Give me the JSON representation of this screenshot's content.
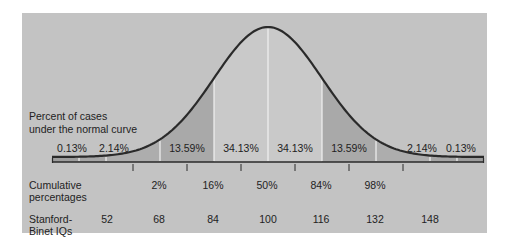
{
  "chart_data": {
    "type": "area",
    "title": "",
    "row_labels": {
      "percent": "Percent of cases under the normal curve",
      "percent_line1": "Percent of cases",
      "percent_line2": "under the normal curve",
      "cumulative_line1": "Cumulative",
      "cumulative_line2": "percentages",
      "iq_line1": "Stanford-",
      "iq_line2": "Binet IQs"
    },
    "bands": [
      {
        "range_sd": "-4 to -3",
        "percent": "0.13%"
      },
      {
        "range_sd": "-3 to -2",
        "percent": "2.14%"
      },
      {
        "range_sd": "-2 to -1",
        "percent": "13.59%"
      },
      {
        "range_sd": "-1 to 0",
        "percent": "34.13%"
      },
      {
        "range_sd": "0 to 1",
        "percent": "34.13%"
      },
      {
        "range_sd": "1 to 2",
        "percent": "13.59%"
      },
      {
        "range_sd": "2 to 3",
        "percent": "2.14%"
      },
      {
        "range_sd": "3 to 4",
        "percent": "0.13%"
      }
    ],
    "band_values": [
      0.13,
      2.14,
      13.59,
      34.13,
      34.13,
      13.59,
      2.14,
      0.13
    ],
    "cumulative_percentages": [
      "2%",
      "16%",
      "50%",
      "84%",
      "98%"
    ],
    "cumulative_values": [
      2,
      16,
      50,
      84,
      98
    ],
    "stanford_binet_iqs": [
      "52",
      "68",
      "84",
      "100",
      "116",
      "132",
      "148"
    ],
    "iq_values": [
      52,
      68,
      84,
      100,
      116,
      132,
      148
    ],
    "mean": 100,
    "sd": 16
  }
}
